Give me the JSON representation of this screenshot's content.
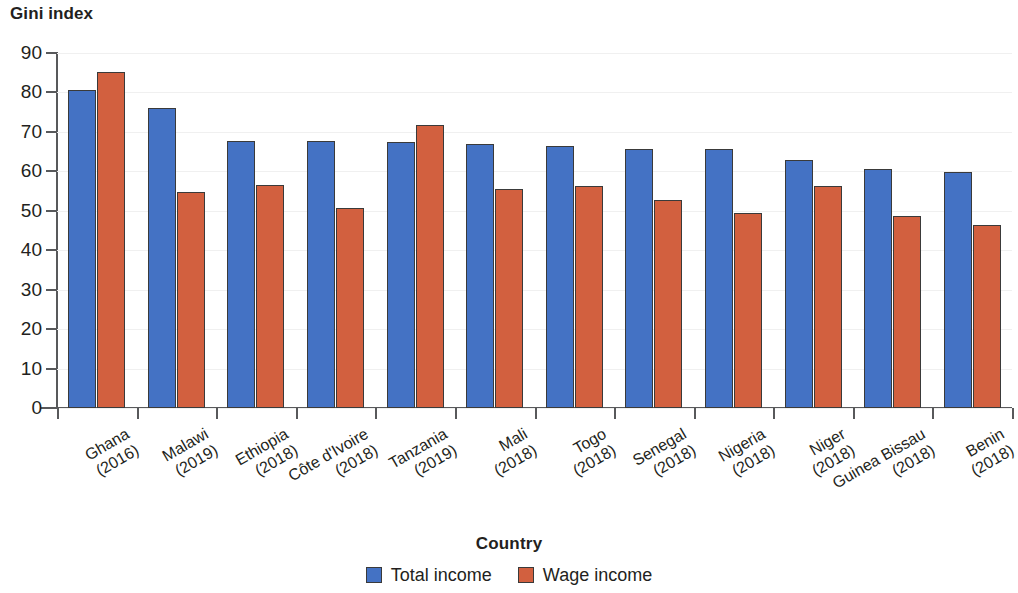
{
  "chart_data": {
    "type": "bar",
    "title": "Gini index",
    "xlabel": "Country",
    "ylabel": "Gini index",
    "ylim": [
      0,
      90
    ],
    "ytick_step": 10,
    "yticks": [
      "90",
      "80",
      "70",
      "60",
      "50",
      "40",
      "30",
      "20",
      "10",
      "0"
    ],
    "grid": true,
    "legend_position": "bottom",
    "categories": [
      "Ghana\n(2016)",
      "Malawi\n(2019)",
      "Ethiopia\n(2018)",
      "Côte d'Ivoire\n(2018)",
      "Tanzania\n(2019)",
      "Mali\n(2018)",
      "Togo\n(2018)",
      "Senegal\n(2018)",
      "Nigeria\n(2018)",
      "Niger\n(2018)",
      "Guinea Bissau\n(2018)",
      "Benin\n(2018)"
    ],
    "category_parts": [
      {
        "name": "Ghana",
        "year": "(2016)"
      },
      {
        "name": "Malawi",
        "year": "(2019)"
      },
      {
        "name": "Ethiopia",
        "year": "(2018)"
      },
      {
        "name": "Côte d'Ivoire",
        "year": "(2018)"
      },
      {
        "name": "Tanzania",
        "year": "(2019)"
      },
      {
        "name": "Mali",
        "year": "(2018)"
      },
      {
        "name": "Togo",
        "year": "(2018)"
      },
      {
        "name": "Senegal",
        "year": "(2018)"
      },
      {
        "name": "Nigeria",
        "year": "(2018)"
      },
      {
        "name": "Niger",
        "year": "(2018)"
      },
      {
        "name": "Guinea Bissau",
        "year": "(2018)"
      },
      {
        "name": "Benin",
        "year": "(2018)"
      }
    ],
    "series": [
      {
        "name": "Total income",
        "color": "#4472c4",
        "values": [
          80.5,
          76.0,
          67.8,
          67.8,
          67.5,
          67.0,
          66.3,
          65.7,
          65.6,
          62.8,
          60.5,
          59.8
        ]
      },
      {
        "name": "Wage income",
        "color": "#d2603f",
        "values": [
          85.1,
          54.7,
          56.5,
          50.8,
          71.8,
          55.6,
          56.3,
          52.7,
          49.5,
          56.3,
          48.7,
          46.3
        ]
      }
    ]
  },
  "legend": {
    "items": [
      {
        "label": "Total income",
        "color": "#4472c4"
      },
      {
        "label": "Wage income",
        "color": "#d2603f"
      }
    ]
  }
}
